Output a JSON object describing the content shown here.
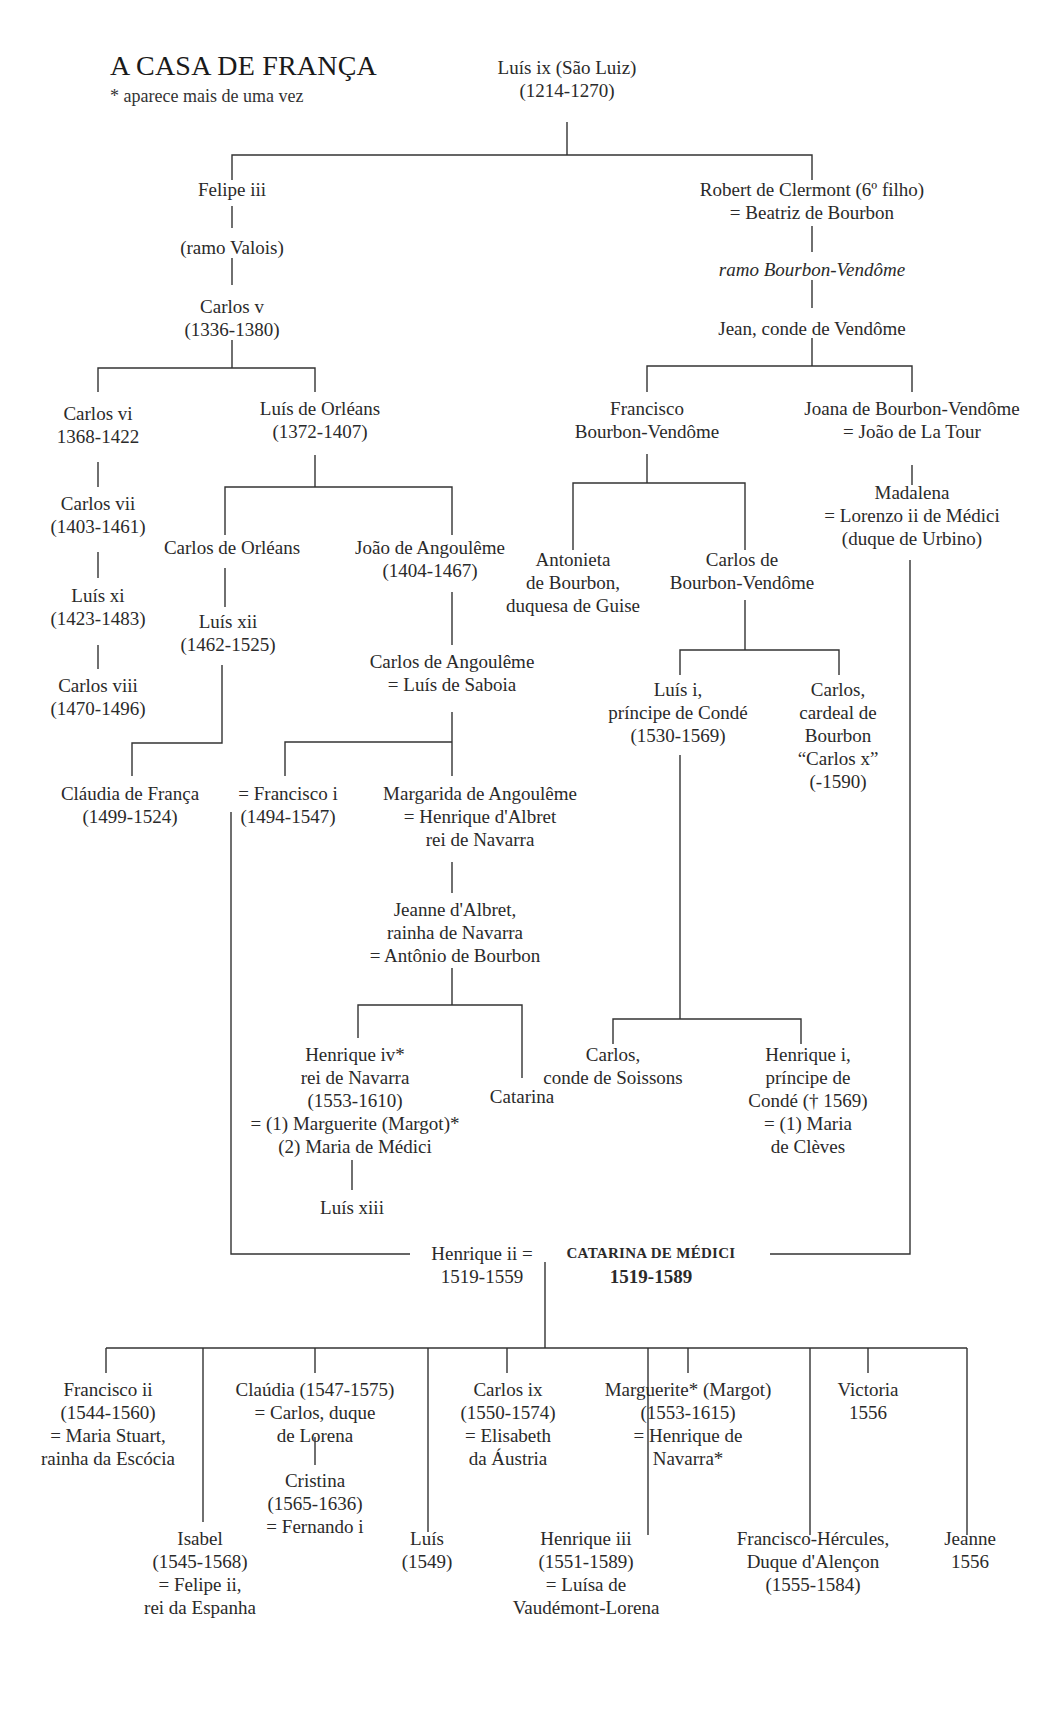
{
  "header": {
    "title": "A CASA DE FRANÇA",
    "note": "* aparece mais de uma vez"
  },
  "nodes": {
    "luis_ix": [
      "Luís ix (São Luiz)",
      "(1214-1270)"
    ],
    "felipe_iii": [
      "Felipe iii"
    ],
    "ramo_valois": [
      "(ramo Valois)"
    ],
    "carlos_v": [
      "Carlos v",
      "(1336-1380)"
    ],
    "robert_clermont": [
      "Robert de Clermont (6º filho)",
      "= Beatriz de Bourbon"
    ],
    "ramo_bourbon_vendome": [
      "ramo Bourbon-Vendôme"
    ],
    "jean_vendome": [
      "Jean, conde de Vendôme"
    ],
    "carlos_vi": [
      "Carlos vi",
      "1368-1422"
    ],
    "luis_orleans": [
      "Luís de Orléans",
      "(1372-1407)"
    ],
    "carlos_vii": [
      "Carlos vii",
      "(1403-1461)"
    ],
    "carlos_orleans": [
      "Carlos de Orléans"
    ],
    "joao_angouleme": [
      "João de Angoulême",
      "(1404-1467)"
    ],
    "luis_xi": [
      "Luís xi",
      "(1423-1483)"
    ],
    "luis_xii": [
      "Luís xii",
      "(1462-1525)"
    ],
    "carlos_viii": [
      "Carlos viii",
      "(1470-1496)"
    ],
    "carlos_angouleme": [
      "Carlos de Angoulême",
      "= Luís de Saboia"
    ],
    "claudia_franca": [
      "Cláudia de França",
      "(1499-1524)"
    ],
    "francisco_i": [
      "= Francisco i",
      "(1494-1547)"
    ],
    "margarida_angouleme": [
      "Margarida de Angoulême",
      "= Henrique d'Albret",
      "rei de Navarra"
    ],
    "jeanne_albret": [
      "Jeanne d'Albret,",
      "rainha de Navarra",
      "= Antônio de Bourbon"
    ],
    "henrique_iv": [
      "Henrique iv*",
      "rei de Navarra",
      "(1553-1610)",
      "= (1) Marguerite (Margot)*",
      "(2) Maria de Médici"
    ],
    "catarina": [
      "Catarina"
    ],
    "luis_xiii": [
      "Luís xiii"
    ],
    "francisco_bv": [
      "Francisco",
      "Bourbon-Vendôme"
    ],
    "joana_bv": [
      "Joana de Bourbon-Vendôme",
      "= João de La Tour"
    ],
    "madalena": [
      "Madalena",
      "= Lorenzo ii de Médici",
      "(duque de Urbino)"
    ],
    "antonieta": [
      "Antonieta",
      "de Bourbon,",
      "duquesa de Guise"
    ],
    "carlos_bv": [
      "Carlos de",
      "Bourbon-Vendôme"
    ],
    "luis_i_conde": [
      "Luís i,",
      "príncipe de Condé",
      "(1530-1569)"
    ],
    "carlos_cardeal": [
      "Carlos,",
      "cardeal de",
      "Bourbon",
      "“Carlos x”",
      "(-1590)"
    ],
    "carlos_soissons": [
      "Carlos,",
      "conde de Soissons"
    ],
    "henrique_i_conde": [
      "Henrique i,",
      "príncipe de",
      "Condé († 1569)",
      "= (1) Maria",
      "de Clèves"
    ],
    "henrique_ii": [
      "Henrique ii =",
      "1519-1559"
    ],
    "catarina_medici": [
      "CATARINA DE MÉDICI",
      "1519-1589"
    ],
    "francisco_ii": [
      "Francisco ii",
      "(1544-1560)",
      "= Maria Stuart,",
      "rainha da Escócia"
    ],
    "isabel": [
      "Isabel",
      "(1545-1568)",
      "= Felipe ii,",
      "rei da Espanha"
    ],
    "claudia": [
      "Claúdia (1547-1575)",
      "= Carlos, duque",
      "de Lorena"
    ],
    "cristina": [
      "Cristina",
      "(1565-1636)",
      "= Fernando i"
    ],
    "luis_1549": [
      "Luís",
      "(1549)"
    ],
    "carlos_ix": [
      "Carlos ix",
      "(1550-1574)",
      "= Elisabeth",
      "da Áustria"
    ],
    "henrique_iii": [
      "Henrique iii",
      "(1551-1589)",
      "= Luísa de",
      "Vaudémont-Lorena"
    ],
    "marguerite": [
      "Marguerite* (Margot)",
      "(1553-1615)",
      "= Henrique de",
      "Navarra*"
    ],
    "francisco_hercules": [
      "Francisco-Hércules,",
      "Duque d'Alençon",
      "(1555-1584)"
    ],
    "victoria": [
      "Victoria",
      "1556"
    ],
    "jeanne_1556": [
      "Jeanne",
      "1556"
    ]
  }
}
